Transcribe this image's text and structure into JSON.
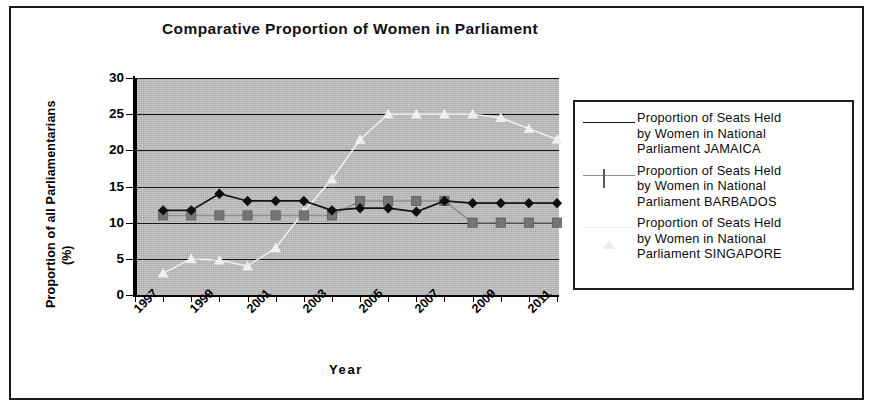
{
  "chart_data": {
    "type": "line",
    "title": "Comparative Proportion of Women in Parliament",
    "xlabel": "Year",
    "ylabel": "Proportion of all Parliamentarians",
    "ylabel_units": "(%)",
    "ylim": [
      0,
      30
    ],
    "ytick_step": 5,
    "yticks": [
      "0",
      "5",
      "10",
      "15",
      "20",
      "25",
      "30"
    ],
    "xlim": [
      1997,
      2012
    ],
    "xticks_labeled": [
      "1997",
      "1999",
      "2001",
      "2003",
      "2005",
      "2007",
      "2009",
      "2011"
    ],
    "x": [
      1998,
      1999,
      2000,
      2001,
      2002,
      2003,
      2004,
      2005,
      2006,
      2007,
      2008,
      2009,
      2010,
      2011,
      2012
    ],
    "grid": "horizontal",
    "plot_background": "#b9b9b9",
    "legend_position": "right",
    "series": [
      {
        "name": "Proportion of Seats Held by Women in National Parliament JAMAICA",
        "country": "JAMAICA",
        "marker": "diamond",
        "color": "#101010",
        "values": [
          11.7,
          11.7,
          14.0,
          13.0,
          13.0,
          13.0,
          11.7,
          12.0,
          12.0,
          11.5,
          13.0,
          12.7,
          12.7,
          12.7,
          12.7
        ]
      },
      {
        "name": "Proportion of Seats Held by Women in National Parliament BARBADOS",
        "country": "BARBADOS",
        "marker": "square",
        "color": "#757575",
        "values": [
          11.0,
          11.0,
          11.0,
          11.0,
          11.0,
          11.0,
          11.0,
          13.0,
          13.0,
          13.0,
          13.0,
          10.0,
          10.0,
          10.0,
          10.0
        ]
      },
      {
        "name": "Proportion of Seats Held by Women in National Parliament SINGAPORE",
        "country": "SINGAPORE",
        "marker": "triangle",
        "color": "#ececec",
        "values": [
          3.0,
          5.0,
          4.8,
          4.0,
          6.5,
          11.5,
          16.0,
          21.5,
          25.0,
          25.0,
          25.0,
          25.0,
          24.5,
          23.0,
          21.5
        ]
      }
    ]
  },
  "legend": {
    "entries": [
      {
        "label": "Proportion of Seats Held\nby Women in National\nParliament JAMAICA"
      },
      {
        "label": "Proportion of Seats Held\nby Women in National\nParliament BARBADOS"
      },
      {
        "label": "Proportion of Seats Held\nby Women in National\nParliament SINGAPORE"
      }
    ]
  }
}
